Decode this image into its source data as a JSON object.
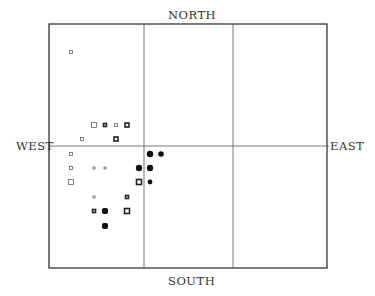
{
  "labels": {
    "north": "NORTH",
    "south": "SOUTH",
    "west": "WEST",
    "east": "EAST"
  },
  "chart_data": {
    "type": "scatter",
    "title": "",
    "xlabel": "WEST — EAST",
    "ylabel": "SOUTH — NORTH",
    "frame": {
      "x0": 49,
      "y0": 24,
      "x1": 327,
      "y1": 268
    },
    "grid": {
      "vertical": [
        144,
        233
      ],
      "horizontal": [
        146
      ]
    },
    "legend": "none",
    "marker_types": [
      "open-square",
      "thick-open-square",
      "filled-square",
      "filled-circle"
    ],
    "points": [
      {
        "x": 71,
        "y": 52,
        "size": 3,
        "style": "open-square"
      },
      {
        "x": 94,
        "y": 125,
        "size": 5,
        "style": "open-square"
      },
      {
        "x": 105,
        "y": 125,
        "size": 3,
        "style": "thick-open-square"
      },
      {
        "x": 116,
        "y": 125,
        "size": 3,
        "style": "open-square"
      },
      {
        "x": 127,
        "y": 125,
        "size": 4,
        "style": "thick-open-square"
      },
      {
        "x": 82,
        "y": 139,
        "size": 3,
        "style": "open-square"
      },
      {
        "x": 116,
        "y": 139,
        "size": 4,
        "style": "thick-open-square"
      },
      {
        "x": 71,
        "y": 154,
        "size": 3,
        "style": "open-square"
      },
      {
        "x": 150,
        "y": 154,
        "size": 4,
        "style": "filled-circle"
      },
      {
        "x": 161,
        "y": 154,
        "size": 3.5,
        "style": "filled-circle"
      },
      {
        "x": 71,
        "y": 168,
        "size": 3,
        "style": "open-square"
      },
      {
        "x": 94,
        "y": 168,
        "size": 2,
        "style": "open-square"
      },
      {
        "x": 105,
        "y": 168,
        "size": 2,
        "style": "open-square"
      },
      {
        "x": 139,
        "y": 168,
        "size": 4,
        "style": "filled-circle"
      },
      {
        "x": 150,
        "y": 168,
        "size": 4,
        "style": "filled-circle"
      },
      {
        "x": 71,
        "y": 182,
        "size": 5,
        "style": "open-square"
      },
      {
        "x": 139,
        "y": 182,
        "size": 5,
        "style": "thick-open-square"
      },
      {
        "x": 150,
        "y": 182,
        "size": 3,
        "style": "filled-circle"
      },
      {
        "x": 94,
        "y": 197,
        "size": 2,
        "style": "open-square"
      },
      {
        "x": 127,
        "y": 197,
        "size": 3,
        "style": "thick-open-square"
      },
      {
        "x": 94,
        "y": 211,
        "size": 3,
        "style": "thick-open-square"
      },
      {
        "x": 105,
        "y": 211,
        "size": 5,
        "style": "filled-square"
      },
      {
        "x": 127,
        "y": 211,
        "size": 5,
        "style": "thick-open-square"
      },
      {
        "x": 105,
        "y": 226,
        "size": 5,
        "style": "filled-square"
      }
    ]
  }
}
